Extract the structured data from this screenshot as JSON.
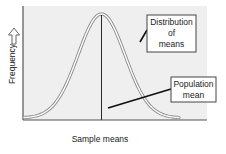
{
  "chart_data": {
    "type": "line",
    "title": "",
    "xlabel": "Sample means",
    "ylabel": "Frequency",
    "ylabel_arrow": "up-arrow",
    "curve": "normal distribution (bell curve)",
    "mean": 0,
    "sd": 1,
    "xlim": [
      -3.3,
      3.3
    ],
    "ylim": [
      0,
      1.1
    ],
    "grid": false,
    "annotations": [
      {
        "id": "dist",
        "lines": [
          "Distribution",
          "of",
          "means"
        ],
        "points_to": "curve (right flank)"
      },
      {
        "id": "pop",
        "lines": [
          "Population",
          "mean"
        ],
        "points_to": "vertical line at mean"
      }
    ]
  },
  "colors": {
    "plot_bg": "#efefef",
    "axis": "#555555",
    "curve_outer": "#8a8a8a",
    "curve_inner": "#ffffff",
    "mean_line": "#2a2a2a",
    "box_border": "#444444",
    "box_bg": "#ffffff"
  }
}
